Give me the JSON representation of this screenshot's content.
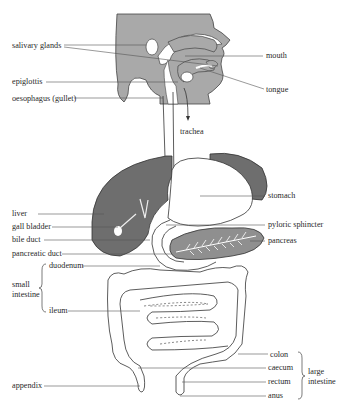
{
  "diagram": {
    "colors": {
      "head": "#a9a9a9",
      "liver": "#6e6e6e",
      "stomach_rim": "#7a7a7a",
      "pancreas": "#8f8f8f",
      "outline": "#333333",
      "leader": "#555555",
      "background": "#ffffff"
    },
    "labels_left": {
      "salivary_glands": "salivary glands",
      "epiglottis": "epiglottis",
      "oesophagus": "oesophagus (gullet)",
      "liver": "liver",
      "gall_bladder": "gall bladder",
      "bile_duct": "bile duct",
      "pancreatic_duct": "pancreatic duct",
      "duodenum": "duodenum",
      "small_intestine": "small intestine",
      "ileum": "ileum",
      "appendix": "appendix"
    },
    "labels_right": {
      "mouth": "mouth",
      "tongue": "tongue",
      "trachea": "trachea",
      "stomach": "stomach",
      "pyloric_sphincter": "pyloric sphincter",
      "pancreas": "pancreas",
      "colon": "colon",
      "caecum": "caecum",
      "rectum": "rectum",
      "anus": "anus",
      "large_intestine": "large intestine"
    }
  }
}
